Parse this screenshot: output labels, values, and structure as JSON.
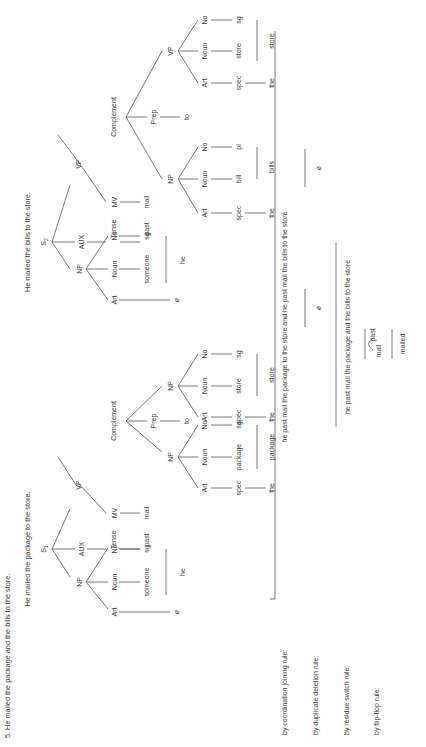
{
  "header": {
    "example_number": "5.",
    "sentence": "He mailed the package and the bills to the store.",
    "s1_sentence": "He mailed the package to the store.",
    "s2_sentence": "He mailed the bills to the store."
  },
  "tree_s1": {
    "root": "S",
    "root_sub": "1",
    "np": "NP",
    "aux": "AUX",
    "vp": "VP",
    "np_art": "Art",
    "np_noun": "Noun",
    "np_no": "No",
    "np_art_val": "ø",
    "np_noun_val": "someone",
    "np_no_val": "sg",
    "np_word": "he",
    "tense": "Tense",
    "tense_val": "past",
    "mv": "MV",
    "mv_val": "mail",
    "complement": "Complement",
    "obj_np": "NP",
    "obj_art": "Art",
    "obj_noun": "Noun",
    "obj_no": "No",
    "obj_art_val": "spec",
    "obj_noun_val": "package",
    "obj_no_val": "sg",
    "obj_art_word": "the",
    "obj_word": "package",
    "prep": "Prep",
    "prep_val": "to",
    "pp_np": "NP",
    "pp_art": "Art",
    "pp_noun": "Noun",
    "pp_no": "No",
    "pp_art_val": "spec",
    "pp_noun_val": "store",
    "pp_no_val": "sg",
    "pp_art_word": "the",
    "pp_word": "store"
  },
  "tree_s2": {
    "root": "S",
    "root_sub": "2",
    "np": "NP",
    "aux": "AUX",
    "vp": "VP",
    "np_art": "Art",
    "np_noun": "Noun",
    "np_no": "No",
    "np_art_val": "ø",
    "np_noun_val": "someone",
    "np_no_val": "sg",
    "np_word": "he",
    "tense": "Tense",
    "tense_val": "past",
    "mv": "MV",
    "mv_val": "mail",
    "complement": "Complement",
    "obj_np": "NP",
    "obj_art": "Art",
    "obj_noun": "Noun",
    "obj_no": "No",
    "obj_art_val": "spec",
    "obj_noun_val": "bill",
    "obj_no_val": "pl",
    "obj_art_word": "the",
    "obj_word": "bills",
    "prep": "Prep",
    "prep_val": "to",
    "pp_np": "VP",
    "pp_art": "Art",
    "pp_noun": "Noun",
    "pp_no": "No",
    "pp_art_val": "spec",
    "pp_noun_val": "store",
    "pp_no_val": "sg",
    "pp_art_word": "the",
    "pp_word": "store"
  },
  "derivation": {
    "coordination_label": "by coordination joining rule:",
    "coordination_result": "he past mail the package to the store and he past mail the bills to the store",
    "deletion_label": "by duplicate deletion rule:",
    "deletion_null_1": "ø",
    "deletion_null_2": "ø",
    "switch_label": "by residue switch rule:",
    "switch_result": "he past mail the package and the bills to the store",
    "flipflop_label": "by flip-flop rule:",
    "flip_left": "mail",
    "flip_right": "past",
    "flip_result": "mailed"
  }
}
